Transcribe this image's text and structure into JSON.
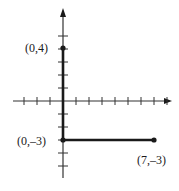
{
  "diagram": {
    "type": "coordinate-graph",
    "origin_px": [
      63,
      101
    ],
    "unit_px": 13,
    "axes": {
      "x": {
        "min_tick": -3,
        "max_tick": 8,
        "arrow": "right"
      },
      "y": {
        "min_tick": -5,
        "max_tick": 5,
        "arrow": "up"
      }
    },
    "segments": [
      {
        "from": [
          0,
          4
        ],
        "to": [
          0,
          -3
        ]
      },
      {
        "from": [
          0,
          -3
        ],
        "to": [
          7,
          -3
        ]
      }
    ],
    "points": [
      {
        "coords": [
          0,
          4
        ],
        "label": "(0,4)"
      },
      {
        "coords": [
          0,
          -3
        ],
        "label": "(0,–3)"
      },
      {
        "coords": [
          7,
          -3
        ],
        "label": "(7,–3)"
      }
    ],
    "colors": {
      "ink": "#1a1a1a",
      "axis": "#333333"
    }
  }
}
